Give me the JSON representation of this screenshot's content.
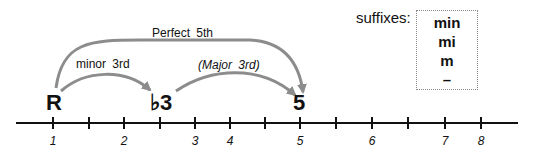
{
  "diagram": {
    "notes": [
      {
        "label": "R",
        "x": 53
      },
      {
        "label": "♭3",
        "x": 160
      },
      {
        "label": "5",
        "x": 300
      }
    ],
    "intervals": [
      {
        "label": "Perfect  5th",
        "from": "R",
        "to": "5",
        "style": "normal"
      },
      {
        "label": "minor  3rd",
        "from": "R",
        "to": "♭3",
        "style": "normal"
      },
      {
        "label": "(Major  3rd)",
        "from": "♭3",
        "to": "5",
        "style": "italic"
      }
    ],
    "axis": {
      "tick_positions": [
        53,
        89,
        124,
        160,
        195,
        230,
        265,
        300,
        336,
        372,
        408,
        445,
        481
      ],
      "labels": [
        {
          "text": "1",
          "x": 53
        },
        {
          "text": "2",
          "x": 124
        },
        {
          "text": "3",
          "x": 195
        },
        {
          "text": "4",
          "x": 230
        },
        {
          "text": "5",
          "x": 300
        },
        {
          "text": "6",
          "x": 372
        },
        {
          "text": "7",
          "x": 445
        },
        {
          "text": "8",
          "x": 481
        }
      ]
    },
    "suffixes": {
      "title": "suffixes:",
      "items": [
        "min",
        "mi",
        "m",
        "–"
      ]
    },
    "colors": {
      "arrow": "#8c8c8c",
      "line": "#111111",
      "box_border": "#8a8a8a"
    }
  }
}
